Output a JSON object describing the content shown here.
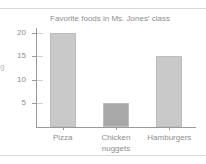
{
  "page": {
    "margin_fragment": "g"
  },
  "chart_data": {
    "type": "bar",
    "title": "Favorite foods in Ms. Jones' class",
    "xlabel": "",
    "ylabel": "",
    "categories": [
      "Pizza",
      "Chicken nuggets",
      "Hamburgers"
    ],
    "values": [
      20,
      5,
      15
    ],
    "ylim": [
      0,
      21
    ],
    "yticks": [
      5,
      10,
      15,
      20
    ],
    "ytick_labels": [
      "5",
      "10",
      "15",
      "20"
    ],
    "grid": false,
    "legend": false,
    "bar_colors": [
      "#c9c9c9",
      "#a8a8a8",
      "#c9c9c9"
    ],
    "axis_color": "#9a9a9a",
    "text_color": "#8d8d8d",
    "bars": [
      {
        "category": "Pizza",
        "value": 20,
        "label": "Pizza",
        "color": "#c9c9c9"
      },
      {
        "category": "Chicken nuggets",
        "value": 5,
        "label": "Chicken\nnuggets",
        "color": "#a8a8a8"
      },
      {
        "category": "Hamburgers",
        "value": 15,
        "label": "Hamburgers",
        "color": "#c9c9c9"
      }
    ]
  }
}
